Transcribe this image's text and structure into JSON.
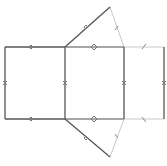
{
  "diagram": {
    "type": "geometric-net",
    "colors": {
      "solid": "#555555",
      "dashed": "#bbbbbb",
      "tick": "#777777",
      "background": "#ffffff"
    },
    "faces": [
      {
        "name": "left-square",
        "style": "solid"
      },
      {
        "name": "middle-square",
        "style": "solid"
      },
      {
        "name": "right-rectangle",
        "style": "faint"
      },
      {
        "name": "top-triangle",
        "style": "mixed"
      },
      {
        "name": "bottom-triangle",
        "style": "mixed"
      }
    ],
    "tick_marks": {
      "single": "slash",
      "double": "diamond",
      "triple": "triple-diamond",
      "cross": "x"
    }
  }
}
